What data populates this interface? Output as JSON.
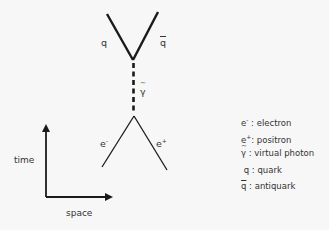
{
  "diagram": {
    "type": "feynman-diagram",
    "process": "electron-positron annihilation into quark-antiquark",
    "colors": {
      "line": "#1a1a1a",
      "background": "#f7f7f7",
      "text": "#333333"
    },
    "particles": {
      "quark": {
        "symbol": "q"
      },
      "antiquark": {
        "symbol": "q"
      },
      "photon": {
        "symbol": "γ"
      },
      "electron": {
        "symbol": "e",
        "charge": "-"
      },
      "positron": {
        "symbol": "e",
        "charge": "+"
      }
    },
    "axes": {
      "y_label": "time",
      "x_label": "space"
    }
  },
  "legend": {
    "items": [
      {
        "symbol": "e",
        "sup": "-",
        "sep": " : ",
        "text": "electron"
      },
      {
        "symbol": "e",
        "sup": "+",
        "sep": ": ",
        "text": "positron"
      },
      {
        "symbol": "γ",
        "sep": " : ",
        "text": "virtual photon"
      },
      {
        "symbol": "q",
        "sep": " :  ",
        "text": "quark"
      },
      {
        "symbol": "q",
        "sep": " : ",
        "text": "antiquark"
      }
    ]
  }
}
